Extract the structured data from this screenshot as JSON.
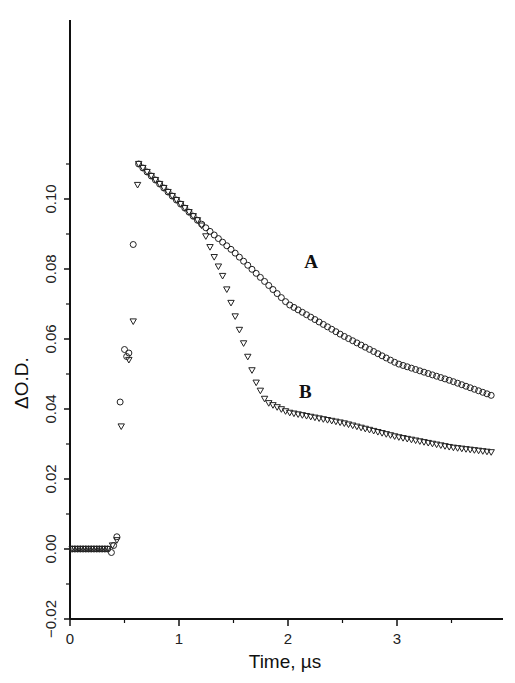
{
  "chart_data": {
    "type": "scatter",
    "title": "",
    "xlabel": "Time, µs",
    "ylabel": "ΔO.D.",
    "xlim": [
      0,
      3.95
    ],
    "ylim": [
      -0.02,
      0.135
    ],
    "grid": false,
    "x_ticks": [
      {
        "value": 0,
        "label": "0"
      },
      {
        "value": 1,
        "label": "1"
      },
      {
        "value": 2,
        "label": "2"
      },
      {
        "value": 3,
        "label": "3"
      }
    ],
    "x_minor_ticks": [
      0.5,
      1.5,
      2.5,
      3.5
    ],
    "y_ticks": [
      {
        "value": -0.02,
        "label": "−0.02"
      },
      {
        "value": 0.0,
        "label": "0.00"
      },
      {
        "value": 0.02,
        "label": "0.02"
      },
      {
        "value": 0.04,
        "label": "0.04"
      },
      {
        "value": 0.06,
        "label": "0.06"
      },
      {
        "value": 0.08,
        "label": "0.08"
      },
      {
        "value": 0.1,
        "label": "0.10"
      }
    ],
    "y_minor_ticks": [
      -0.01,
      0.01,
      0.03,
      0.05,
      0.07,
      0.09,
      0.11
    ],
    "annotations": [
      {
        "text": "A",
        "x": 2.15,
        "y": 0.082
      },
      {
        "text": "B",
        "x": 2.1,
        "y": 0.045
      }
    ],
    "series": [
      {
        "name": "A",
        "marker": "circle",
        "baseline": {
          "t_start": 0.0,
          "t_end": 0.36,
          "value": 0.0
        },
        "rise_points": [
          {
            "t": 0.38,
            "y": -0.001
          },
          {
            "t": 0.4,
            "y": 0.001
          },
          {
            "t": 0.43,
            "y": 0.0035
          },
          {
            "t": 0.46,
            "y": 0.042
          },
          {
            "t": 0.5,
            "y": 0.057
          },
          {
            "t": 0.52,
            "y": 0.055
          },
          {
            "t": 0.54,
            "y": 0.056
          },
          {
            "t": 0.58,
            "y": 0.087
          }
        ],
        "decay_points": [
          {
            "t": 0.63,
            "y": 0.11
          },
          {
            "t": 1.0,
            "y": 0.099
          },
          {
            "t": 1.2,
            "y": 0.093
          },
          {
            "t": 1.5,
            "y": 0.085
          },
          {
            "t": 2.0,
            "y": 0.07
          },
          {
            "t": 2.5,
            "y": 0.061
          },
          {
            "t": 3.0,
            "y": 0.053
          },
          {
            "t": 3.5,
            "y": 0.048
          },
          {
            "t": 3.9,
            "y": 0.0435
          }
        ]
      },
      {
        "name": "B",
        "marker": "triangle-down",
        "baseline": {
          "t_start": 0.0,
          "t_end": 0.36,
          "value": 0.0
        },
        "rise_points": [
          {
            "t": 0.39,
            "y": 0.001
          },
          {
            "t": 0.43,
            "y": 0.0025
          },
          {
            "t": 0.47,
            "y": 0.035
          },
          {
            "t": 0.54,
            "y": 0.054
          },
          {
            "t": 0.58,
            "y": 0.065
          },
          {
            "t": 0.62,
            "y": 0.104
          }
        ],
        "decay_points": [
          {
            "t": 0.63,
            "y": 0.11
          },
          {
            "t": 1.0,
            "y": 0.099
          },
          {
            "t": 1.2,
            "y": 0.093
          },
          {
            "t": 1.3,
            "y": 0.085
          },
          {
            "t": 1.4,
            "y": 0.078
          },
          {
            "t": 1.5,
            "y": 0.068
          },
          {
            "t": 1.6,
            "y": 0.058
          },
          {
            "t": 1.7,
            "y": 0.048
          },
          {
            "t": 1.8,
            "y": 0.042
          },
          {
            "t": 2.0,
            "y": 0.039
          },
          {
            "t": 2.5,
            "y": 0.036
          },
          {
            "t": 3.0,
            "y": 0.032
          },
          {
            "t": 3.5,
            "y": 0.029
          },
          {
            "t": 3.9,
            "y": 0.0275
          }
        ]
      }
    ]
  }
}
